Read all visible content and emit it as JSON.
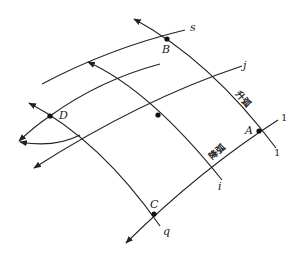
{
  "diagram": {
    "points": {
      "A": "A",
      "B": "B",
      "C": "C",
      "D": "D"
    },
    "line_labels": {
      "s": "s",
      "j": "j",
      "i": "i",
      "q": "q",
      "one_upper": "1",
      "one_lower": "1"
    },
    "arc_labels": {
      "ascending": "升弧",
      "descending": "降弧"
    },
    "colors": {
      "stroke": "#222222",
      "background": "#ffffff"
    }
  }
}
